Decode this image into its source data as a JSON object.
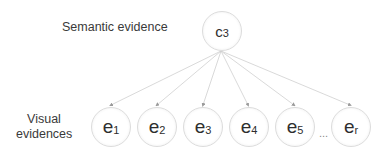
{
  "labels": {
    "semantic": "Semantic evidence",
    "visual_line1": "Visual",
    "visual_line2": "evidences"
  },
  "top_node": {
    "main": "c",
    "sub": "3"
  },
  "bottom_nodes": [
    {
      "main": "e",
      "sub": "1"
    },
    {
      "main": "e",
      "sub": "2"
    },
    {
      "main": "e",
      "sub": "3"
    },
    {
      "main": "e",
      "sub": "4"
    },
    {
      "main": "e",
      "sub": "5"
    },
    {
      "main": "e",
      "sub": "r"
    }
  ],
  "ellipsis": "...",
  "colors": {
    "edge": "#c8c8c8",
    "node_border": "#dcdcdc",
    "text": "#2e2e2e"
  }
}
